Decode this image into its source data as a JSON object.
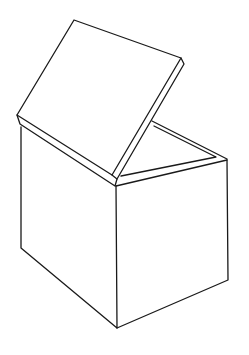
{
  "illustration": {
    "subject": "open-box-line-drawing",
    "stroke_color": "#1a1a1a",
    "background_color": "#ffffff"
  }
}
